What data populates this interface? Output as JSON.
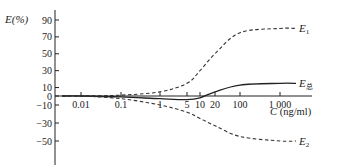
{
  "chart_data": {
    "type": "line",
    "title": "",
    "ylabel": "E(%)",
    "xlabel": "C (ng/ml)",
    "xscale": "log",
    "y_ticks": [
      90,
      70,
      50,
      30,
      10,
      0,
      -10,
      -30,
      -50
    ],
    "x_ticks": [
      {
        "label": "0.01",
        "value": 0.01
      },
      {
        "label": "0.1",
        "value": 0.1
      },
      {
        "label": "1",
        "value": 1
      },
      {
        "label": "5",
        "value": 5
      },
      {
        "label": "10",
        "value": 10
      },
      {
        "label": "20",
        "value": 20
      },
      {
        "label": "100",
        "value": 100
      },
      {
        "label": "1 000",
        "value": 1000
      }
    ],
    "ylim": [
      -70,
      95
    ],
    "grid": false,
    "legend": "inline labels at line ends",
    "series": [
      {
        "name": "E1",
        "label_main": "E",
        "label_sub": "1",
        "style": "dashed",
        "x": [
          0.01,
          0.1,
          1,
          5,
          10,
          20,
          100,
          1000,
          3000
        ],
        "values": [
          0,
          1,
          5,
          15,
          30,
          50,
          75,
          80,
          80
        ]
      },
      {
        "name": "E总",
        "label_main": "E",
        "label_sub": "总",
        "style": "solid",
        "x": [
          0.01,
          0.1,
          1,
          5,
          10,
          20,
          100,
          1000,
          3000
        ],
        "values": [
          0,
          -1,
          -3,
          -4,
          -2,
          5,
          13,
          15,
          15
        ]
      },
      {
        "name": "E2",
        "label_main": "E",
        "label_sub": "2",
        "style": "dashed",
        "x": [
          0.01,
          0.1,
          1,
          5,
          10,
          20,
          100,
          1000,
          3000
        ],
        "values": [
          0,
          -3,
          -10,
          -18,
          -25,
          -33,
          -45,
          -50,
          -50
        ]
      }
    ]
  }
}
